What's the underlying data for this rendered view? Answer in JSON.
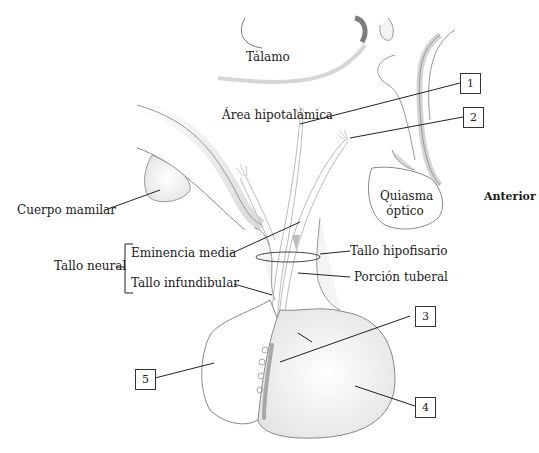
{
  "diagram": {
    "orientation_label": "Anterior",
    "regions": {
      "thalamus": "Tálamo",
      "hypothalamic_area": "Área hipotalámica",
      "optic_chiasm_line1": "Quiasma",
      "optic_chiasm_line2": "óptico",
      "mammillary_body": "Cuerpo mamilar"
    },
    "neural_stalk": {
      "group_label": "Tallo neural",
      "items": [
        "Eminencia media",
        "Tallo infundibular"
      ]
    },
    "right_labels": {
      "hypophyseal_stalk": "Tallo hipofisario",
      "tuberal_portion": "Porción tuberal"
    },
    "numbered_callouts": [
      "1",
      "2",
      "3",
      "4",
      "5"
    ]
  }
}
